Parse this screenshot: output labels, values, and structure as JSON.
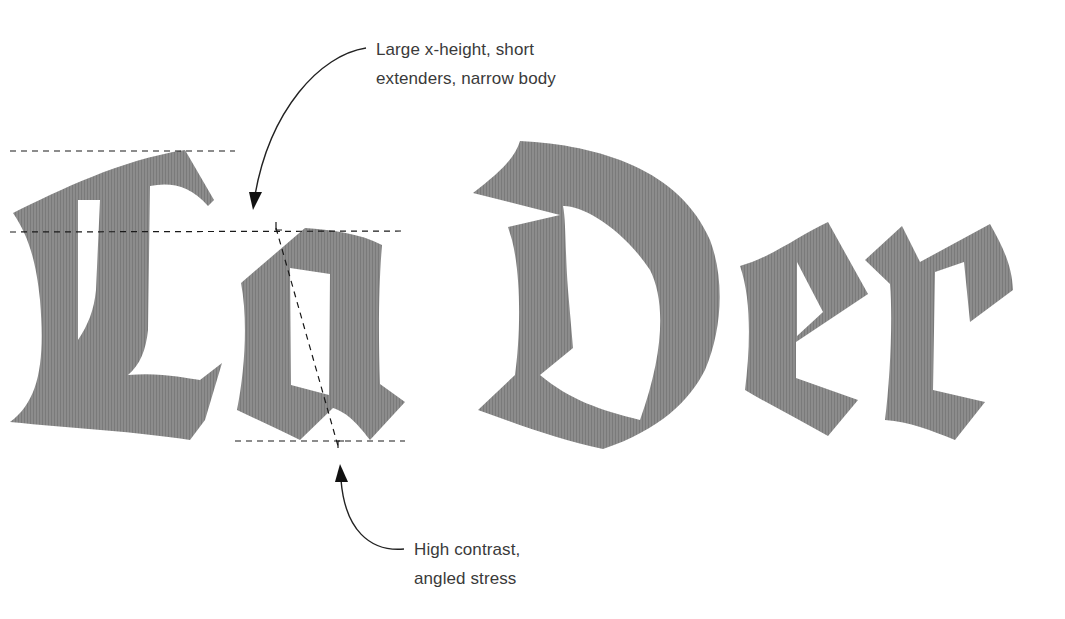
{
  "diagram": {
    "specimen_text": "La Der",
    "glyphs": [
      {
        "char": "L",
        "style": "blackletter"
      },
      {
        "char": "a",
        "style": "blackletter"
      },
      {
        "char": "D",
        "style": "blackletter"
      },
      {
        "char": "e",
        "style": "blackletter"
      },
      {
        "char": "r",
        "style": "blackletter"
      }
    ],
    "glyph_fill": "#8a8a8a",
    "guide_color": "#1a1a1a",
    "guidelines": [
      {
        "name": "ascender-line",
        "y": 151,
        "x1": 10,
        "x2": 235
      },
      {
        "name": "x-height-line",
        "y": 231,
        "x1": 10,
        "x2": 405
      },
      {
        "name": "baseline",
        "y": 441,
        "x1": 235,
        "x2": 405
      },
      {
        "name": "stress-axis",
        "from": [
          276,
          228
        ],
        "to": [
          338,
          446
        ]
      }
    ],
    "annotations": [
      {
        "id": "top",
        "lines": [
          "Large x-height, short",
          "extenders, narrow body"
        ],
        "arrow": "curved arrow pointing down-left to x-height gap"
      },
      {
        "id": "bottom",
        "lines": [
          "High contrast,",
          "angled stress"
        ],
        "arrow": "curved arrow pointing up to stress axis"
      }
    ]
  }
}
